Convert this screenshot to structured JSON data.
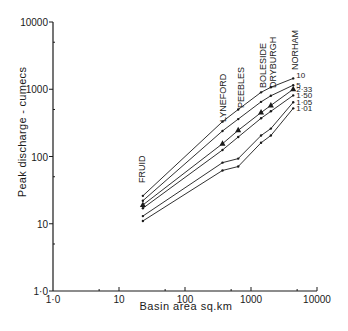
{
  "chart_data": {
    "type": "line",
    "title": "",
    "xlabel": "Basin area sq.km",
    "ylabel": "Peak discharge - cumecs",
    "xscale": "log",
    "yscale": "log",
    "xlim": [
      1,
      10000
    ],
    "ylim": [
      1,
      10000
    ],
    "x_tick_labels": [
      "1·0",
      "10",
      "100",
      "1000",
      "10000"
    ],
    "x_ticks": [
      1,
      10,
      100,
      1000,
      10000
    ],
    "y_tick_labels": [
      "1·0",
      "10",
      "100",
      "1000",
      "10000"
    ],
    "y_ticks": [
      1,
      10,
      100,
      1000,
      10000
    ],
    "grid": false,
    "stations": [
      "FRUID",
      "LYNEFORD",
      "PEEBLES",
      "BOLESIDE",
      "DRYBURGH",
      "NORHAM"
    ],
    "x": [
      23,
      370,
      640,
      1420,
      2000,
      4360
    ],
    "series": [
      {
        "name": "10",
        "values": [
          26,
          330,
          500,
          900,
          1070,
          1450
        ]
      },
      {
        "name": "5",
        "values": [
          22,
          240,
          360,
          650,
          800,
          1150
        ]
      },
      {
        "name": "2·33",
        "values": [
          19,
          155,
          245,
          450,
          575,
          1000
        ],
        "marker": "triangle"
      },
      {
        "name": "1·50",
        "values": [
          17,
          125,
          195,
          370,
          470,
          810
        ]
      },
      {
        "name": "1·05",
        "values": [
          13,
          81,
          93,
          205,
          260,
          640
        ]
      },
      {
        "name": "1·01",
        "values": [
          11,
          62,
          71,
          160,
          205,
          520
        ]
      }
    ],
    "legend_position": "right end of lines",
    "annotations": [
      "FRUID",
      "LYNEFORD",
      "PEEBLES",
      "BOLESIDE",
      "DRYBURGH",
      "NORHAM"
    ]
  }
}
